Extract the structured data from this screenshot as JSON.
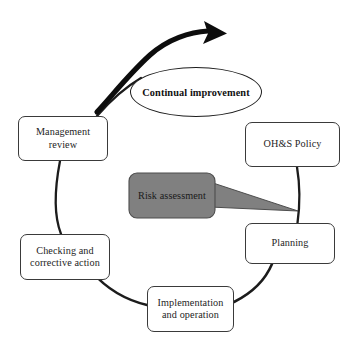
{
  "diagram": {
    "background_color": "#ffffff",
    "line_color": "#1c1c1c",
    "box_border_color": "#3a3a3a",
    "callout_fill_color": "#808080",
    "callout_border_color": "#4d4d4d",
    "nodes": {
      "continual_improvement": {
        "label": "Continual improvement",
        "shape": "ellipse"
      },
      "ohs_policy": {
        "label": "OH&S Policy",
        "shape": "rounded-rect"
      },
      "planning": {
        "label": "Planning",
        "shape": "rounded-rect"
      },
      "implementation": {
        "label": "Implementation\nand operation",
        "shape": "rounded-rect"
      },
      "checking": {
        "label": "Checking and\ncorrective action",
        "shape": "rounded-rect"
      },
      "management_review": {
        "label": "Management\nreview",
        "shape": "rounded-rect"
      },
      "risk_assessment": {
        "label": "Risk assessment",
        "shape": "callout"
      }
    },
    "arrows": {
      "continual_improvement_arrow": {
        "name": "continual-improvement-arrow",
        "direction": "clockwise-up-right"
      }
    }
  }
}
